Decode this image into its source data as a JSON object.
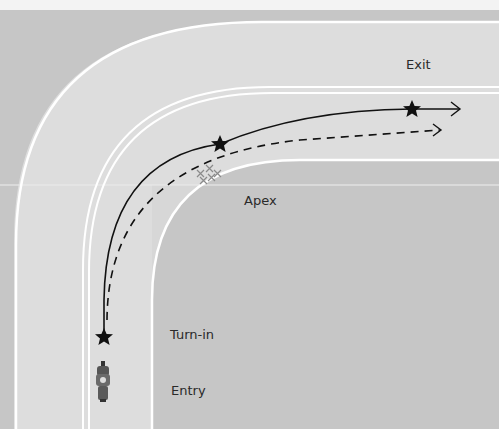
{
  "diagram": {
    "labels": {
      "exit": "Exit",
      "apex": "Apex",
      "turn_in": "Turn-in",
      "entry": "Entry"
    },
    "paths": [
      {
        "name": "ideal-line",
        "style": "solid"
      },
      {
        "name": "alternate-line",
        "style": "dashed"
      }
    ],
    "markers": [
      "turn-in",
      "mid-corner",
      "exit"
    ],
    "colors": {
      "background": "#c9c9c9",
      "road": "#dedede",
      "inner_area": "#cccccc",
      "lane_line": "#ffffff",
      "path": "#111111",
      "apex_marks": "#8a8a8a"
    }
  }
}
